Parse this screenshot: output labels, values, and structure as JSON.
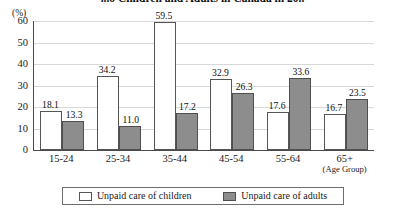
{
  "chart_data": {
    "type": "bar",
    "title": "...o Children and Adults in Canada in 20..",
    "xlabel": "(Age Group)",
    "ylabel": "(%)",
    "ylim": [
      0,
      60
    ],
    "ytick_step": 10,
    "yticks": [
      "60",
      "50",
      "40",
      "30",
      "20",
      "10",
      "0"
    ],
    "grid": true,
    "legend_position": "bottom",
    "categories": [
      "15-24",
      "25-34",
      "35-44",
      "45-54",
      "55-64",
      "65+"
    ],
    "series": [
      {
        "name": "Unpaid care of children",
        "color": "#ffffff",
        "values": [
          18.1,
          34.2,
          59.5,
          32.9,
          17.6,
          16.7
        ],
        "labels": [
          "18.1",
          "34.2",
          "59.5",
          "32.9",
          "17.6",
          "16.7"
        ]
      },
      {
        "name": "Unpaid care of adults",
        "color": "#8d8d8d",
        "values": [
          13.3,
          11.0,
          17.2,
          26.3,
          33.6,
          23.5
        ],
        "labels": [
          "13.3",
          "11.0",
          "17.2",
          "26.3",
          "33.6",
          "23.5"
        ]
      }
    ]
  }
}
